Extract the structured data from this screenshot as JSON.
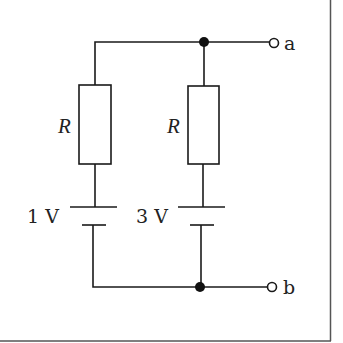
{
  "diagram": {
    "type": "circuit",
    "branches": [
      {
        "resistor_label": "R",
        "battery_label": "1 V"
      },
      {
        "resistor_label": "R",
        "battery_label": "3 V"
      }
    ],
    "terminals": [
      {
        "label": "a"
      },
      {
        "label": "b"
      }
    ],
    "colors": {
      "wire": "#1a1a1a",
      "border": "#555555",
      "background": "#ffffff"
    }
  }
}
